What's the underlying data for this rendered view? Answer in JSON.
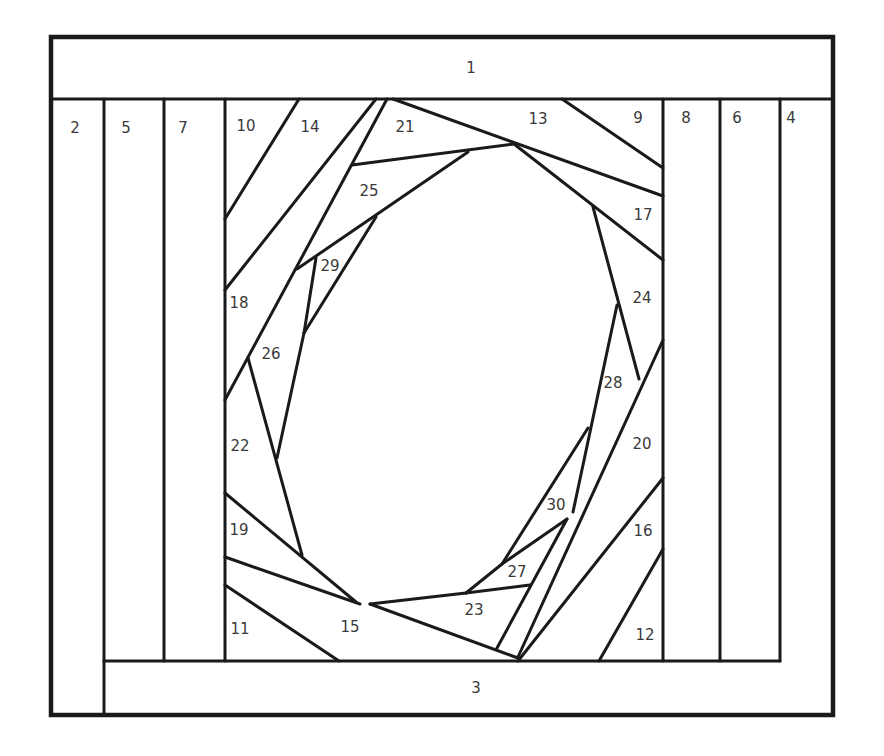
{
  "diagram": {
    "type": "quilt-paper-piecing-pattern",
    "colors": {
      "line": "#1a1a1a",
      "label": "#3a3a3a",
      "background": "#ffffff"
    },
    "pieces": [
      {
        "id": "1",
        "x": 471,
        "y": 68
      },
      {
        "id": "2",
        "x": 75,
        "y": 128
      },
      {
        "id": "3",
        "x": 476,
        "y": 688
      },
      {
        "id": "4",
        "x": 791,
        "y": 118
      },
      {
        "id": "5",
        "x": 126,
        "y": 128
      },
      {
        "id": "6",
        "x": 737,
        "y": 118
      },
      {
        "id": "7",
        "x": 183,
        "y": 128
      },
      {
        "id": "8",
        "x": 686,
        "y": 118
      },
      {
        "id": "9",
        "x": 638,
        "y": 118
      },
      {
        "id": "10",
        "x": 246,
        "y": 126
      },
      {
        "id": "11",
        "x": 240,
        "y": 629
      },
      {
        "id": "12",
        "x": 645,
        "y": 635
      },
      {
        "id": "13",
        "x": 538,
        "y": 119
      },
      {
        "id": "14",
        "x": 310,
        "y": 127
      },
      {
        "id": "15",
        "x": 350,
        "y": 627
      },
      {
        "id": "16",
        "x": 643,
        "y": 531
      },
      {
        "id": "17",
        "x": 643,
        "y": 215
      },
      {
        "id": "18",
        "x": 239,
        "y": 303
      },
      {
        "id": "19",
        "x": 239,
        "y": 530
      },
      {
        "id": "20",
        "x": 642,
        "y": 444
      },
      {
        "id": "21",
        "x": 405,
        "y": 127
      },
      {
        "id": "22",
        "x": 240,
        "y": 446
      },
      {
        "id": "23",
        "x": 474,
        "y": 610
      },
      {
        "id": "24",
        "x": 642,
        "y": 298
      },
      {
        "id": "25",
        "x": 369,
        "y": 191
      },
      {
        "id": "26",
        "x": 271,
        "y": 354
      },
      {
        "id": "27",
        "x": 517,
        "y": 572
      },
      {
        "id": "28",
        "x": 613,
        "y": 383
      },
      {
        "id": "29",
        "x": 330,
        "y": 266
      },
      {
        "id": "30",
        "x": 556,
        "y": 505
      }
    ]
  }
}
